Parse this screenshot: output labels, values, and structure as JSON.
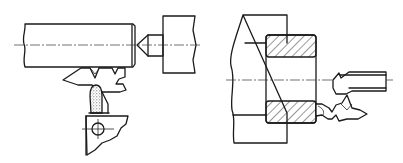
{
  "figure": {
    "type": "technical-drawing",
    "background": "#ffffff",
    "line_color": "#1a1a1a",
    "panels": [
      {
        "id": "left",
        "description": "Shaft workpiece held between spindle center and tailstock; form tool with dressing stone below, tool holder with bolt",
        "parts": [
          "shaft",
          "center-point",
          "tailstock-body",
          "form-tool",
          "dressing-stone",
          "tool-holder",
          "holder-bolt",
          "centerline"
        ]
      },
      {
        "id": "right",
        "description": "Ring workpiece (sectioned, hatched) clamped on fixture; form cutting tool on bar approaching from right",
        "parts": [
          "fixture-body",
          "ring-workpiece-top-section",
          "ring-workpiece-bottom-section",
          "boring-bar",
          "form-tool",
          "centerline"
        ]
      }
    ]
  }
}
